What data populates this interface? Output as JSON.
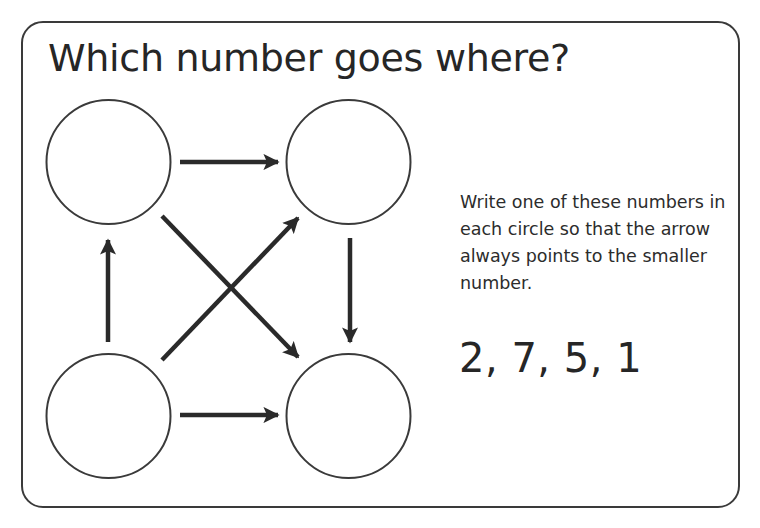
{
  "worksheet": {
    "title": "Which number goes where?",
    "instructions": "Write one of these numbers in each circle so that the arrow always points to the smaller number.",
    "number_set_label": "2, 7, 5, 1",
    "numbers": [
      2,
      7,
      5,
      1
    ]
  },
  "diagram": {
    "nodes": [
      {
        "id": "top-left",
        "value": ""
      },
      {
        "id": "top-right",
        "value": ""
      },
      {
        "id": "bottom-left",
        "value": ""
      },
      {
        "id": "bottom-right",
        "value": ""
      }
    ],
    "arrows": [
      {
        "from": "top-left",
        "to": "top-right"
      },
      {
        "from": "top-left",
        "to": "bottom-right"
      },
      {
        "from": "bottom-left",
        "to": "top-left"
      },
      {
        "from": "bottom-left",
        "to": "top-right"
      },
      {
        "from": "bottom-left",
        "to": "bottom-right"
      },
      {
        "from": "top-right",
        "to": "bottom-right"
      }
    ],
    "stroke_color": "#2a2a2a",
    "circle_color": "#3a3a3a"
  }
}
